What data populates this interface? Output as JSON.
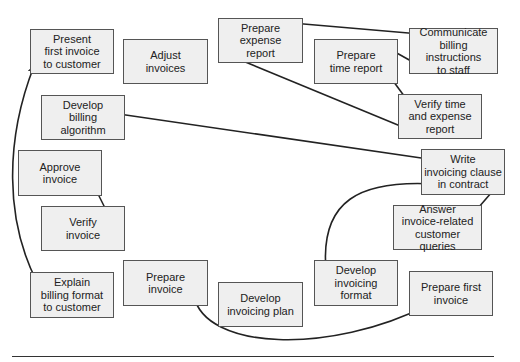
{
  "diagram": {
    "type": "activity-network",
    "tasks": [
      {
        "id": "present-first-invoice",
        "label": "Present\nfirst invoice\nto customer"
      },
      {
        "id": "adjust-invoices",
        "label": "Adjust\ninvoices"
      },
      {
        "id": "prepare-expense-report",
        "label": "Prepare\nexpense\nreport"
      },
      {
        "id": "communicate-billing-instructions",
        "label": "Communicate\nbilling instructions\nto staff"
      },
      {
        "id": "prepare-time-report",
        "label": "Prepare\ntime report"
      },
      {
        "id": "develop-billing-algorithm",
        "label": "Develop\nbilling\nalgorithm"
      },
      {
        "id": "verify-time-expense-report",
        "label": "Verify time\nand expense\nreport"
      },
      {
        "id": "approve-invoice",
        "label": "Approve\ninvoice"
      },
      {
        "id": "write-invoicing-clause",
        "label": "Write\ninvoicing clause\nin contract"
      },
      {
        "id": "verify-invoice",
        "label": "Verify\ninvoice"
      },
      {
        "id": "answer-customer-queries",
        "label": "Answer\ninvoice-related\ncustomer queries"
      },
      {
        "id": "explain-billing-format",
        "label": "Explain\nbilling format\nto customer"
      },
      {
        "id": "prepare-invoice",
        "label": "Prepare\ninvoice"
      },
      {
        "id": "develop-invoicing-plan",
        "label": "Develop\ninvoicing plan"
      },
      {
        "id": "develop-invoicing-format",
        "label": "Develop\ninvoicing\nformat"
      },
      {
        "id": "prepare-first-invoice",
        "label": "Prepare first\ninvoice"
      }
    ],
    "links": [
      {
        "from": "prepare-expense-report",
        "to": "communicate-billing-instructions",
        "bidirectional": true
      },
      {
        "from": "prepare-time-report",
        "to": "communicate-billing-instructions",
        "bidirectional": true
      },
      {
        "from": "prepare-time-report",
        "to": "verify-time-expense-report",
        "bidirectional": true
      },
      {
        "from": "prepare-expense-report",
        "to": "verify-time-expense-report",
        "bidirectional": true
      },
      {
        "from": "develop-billing-algorithm",
        "to": "write-invoicing-clause",
        "bidirectional": true
      },
      {
        "from": "approve-invoice",
        "to": "verify-invoice",
        "bidirectional": true
      },
      {
        "from": "write-invoicing-clause",
        "to": "answer-customer-queries",
        "bidirectional": true
      },
      {
        "from": "write-invoicing-clause",
        "to": "develop-invoicing-format",
        "bidirectional": true
      },
      {
        "from": "present-first-invoice",
        "to": "explain-billing-format",
        "bidirectional": true
      },
      {
        "from": "prepare-invoice",
        "to": "prepare-first-invoice",
        "bidirectional": true
      }
    ]
  }
}
